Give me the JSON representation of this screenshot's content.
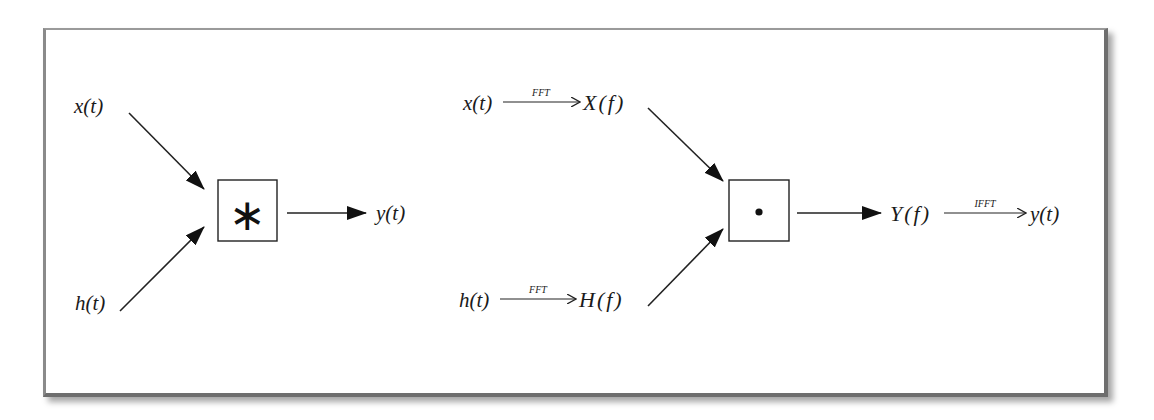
{
  "diagram": {
    "left": {
      "inputs": [
        {
          "label": "x(t)"
        },
        {
          "label": "h(t)"
        }
      ],
      "operator": {
        "symbol": "∗",
        "meaning": "convolution"
      },
      "output": {
        "label": "y(t)"
      }
    },
    "right": {
      "inputs": [
        {
          "time_label": "x(t)",
          "transform": "FFT",
          "freq_label": "X(f)"
        },
        {
          "time_label": "h(t)",
          "transform": "FFT",
          "freq_label": "H(f)"
        }
      ],
      "operator": {
        "symbol": "•",
        "meaning": "multiplication"
      },
      "output": {
        "freq_label": "Y(f)",
        "transform": "IFFT",
        "time_label": "y(t)"
      }
    },
    "colors": {
      "stroke": "#1a1a1a",
      "frame": "#7a7a7a",
      "background": "#ffffff"
    }
  }
}
